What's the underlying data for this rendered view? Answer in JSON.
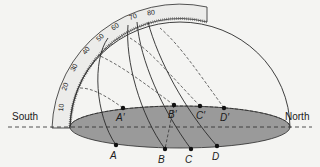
{
  "diagram": {
    "type": "celestial-hemisphere-sun-paths",
    "labels": {
      "south": "South",
      "north": "North"
    },
    "protractor_ticks": [
      "10",
      "20",
      "30",
      "40",
      "50",
      "60",
      "70",
      "80"
    ],
    "points_lower": [
      "A",
      "B",
      "C",
      "D"
    ],
    "points_upper": [
      "A′",
      "B′",
      "C′",
      "D′"
    ],
    "colors": {
      "background": "#f4f4f2",
      "ellipse_fill": "#9a9a9a",
      "line": "#2a2a2a",
      "protractor_fill": "#ececea"
    }
  }
}
